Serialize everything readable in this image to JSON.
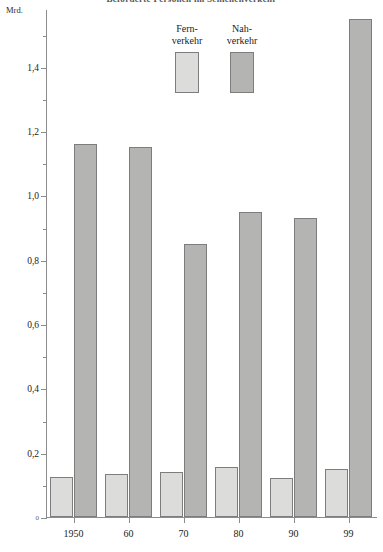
{
  "chart_data": {
    "type": "bar",
    "title": "Beförderte Personen im Schienenverkehr",
    "unit_label": "Mrd.",
    "xlabel": "",
    "ylabel": "Mrd.",
    "categories": [
      "1950",
      "60",
      "70",
      "80",
      "90",
      "99"
    ],
    "series": [
      {
        "name": "Fern-\nverkehr",
        "name_line1": "Fern-",
        "name_line2": "verkehr",
        "color": "#dcdcda",
        "values": [
          0.125,
          0.135,
          0.14,
          0.155,
          0.12,
          0.15
        ]
      },
      {
        "name": "Nah-\nverkehr",
        "name_line1": "Nah-",
        "name_line2": "verkehr",
        "color": "#b4b4b2",
        "values": [
          1.16,
          1.15,
          0.85,
          0.95,
          0.93,
          1.55
        ]
      }
    ],
    "ylim": [
      0,
      1.58
    ],
    "y_major_ticks": [
      {
        "value": 0,
        "label": "0"
      },
      {
        "value": 0.2,
        "label": "0,2"
      },
      {
        "value": 0.4,
        "label": "0,4"
      },
      {
        "value": 0.6,
        "label": "0,6"
      },
      {
        "value": 0.8,
        "label": "0,8"
      },
      {
        "value": 1.0,
        "label": "1,0"
      },
      {
        "value": 1.2,
        "label": "1,2"
      },
      {
        "value": 1.4,
        "label": "1,4"
      }
    ],
    "y_minor_ticks": [
      0.1,
      0.3,
      0.5,
      0.7,
      0.9,
      1.1,
      1.3,
      1.5
    ],
    "grid": false,
    "legend_position": "top-center"
  }
}
